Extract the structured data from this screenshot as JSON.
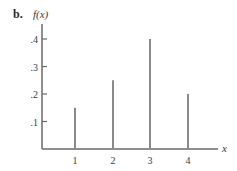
{
  "panel_label": "b.",
  "chart_data": {
    "type": "bar",
    "title": "",
    "xlabel": "x",
    "ylabel": "f(x)",
    "categories": [
      "1",
      "2",
      "3",
      "4"
    ],
    "x": [
      1,
      2,
      3,
      4
    ],
    "values": [
      0.15,
      0.25,
      0.4,
      0.2
    ],
    "ylim": [
      0,
      0.45
    ],
    "yticks": [
      0.1,
      0.2,
      0.3,
      0.4
    ],
    "ytick_labels": [
      ".1",
      ".2",
      ".3",
      ".4"
    ],
    "xtick_labels": [
      "1",
      "2",
      "3",
      "4"
    ],
    "grid": false,
    "legend": null,
    "bar_style": "thin vertical lines (probability mass function)",
    "bar_color": "#8a8a8a",
    "axis_color": "#6a6a6a"
  }
}
